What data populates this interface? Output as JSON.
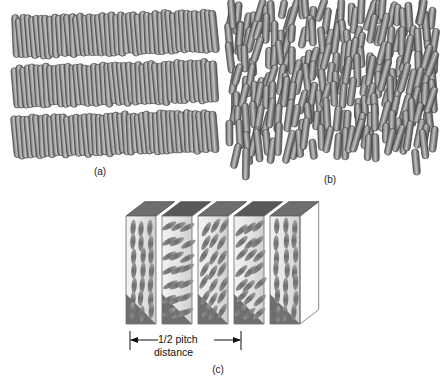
{
  "figure": {
    "panels": [
      {
        "id": "a",
        "label": "(a)",
        "phase_name": "smectic",
        "description": "Rod-shaped molecules arranged in parallel, well-defined stacked layers"
      },
      {
        "id": "b",
        "label": "(b)",
        "phase_name": "nematic",
        "description": "Rod-shaped molecules aligned along a common direction without layered positional order"
      },
      {
        "id": "c",
        "label": "(c)",
        "phase_name": "cholesteric",
        "description": "Stacked slabs in which the molecular director rotates progressively through a half pitch"
      }
    ],
    "dimension": {
      "line1": "1/2 pitch",
      "line2": "distance"
    },
    "colors": {
      "rod_fill": "#7b7b7b",
      "rod_outline": "#3c3c3c",
      "rod_highlight": "#b9b9b9",
      "face_light": "#e9e9e9",
      "face_mid": "#d2d2d2",
      "face_shadow": "#6e6e6e",
      "face_dark": "#585858",
      "ellipse_fill": "#8a8a8a",
      "outline": "#4a4a4a",
      "text": "#111111",
      "background": "#ffffff"
    }
  },
  "chart_data": {
    "type": "diagram",
    "panels": [
      {
        "id": "a",
        "label": "(a)",
        "phase": "smectic",
        "layers": 3,
        "rods_per_layer": 46,
        "order": "positional and orientational",
        "tilt_deg": -4
      },
      {
        "id": "b",
        "label": "(b)",
        "phase": "nematic",
        "layers": 0,
        "rod_count": 210,
        "order": "orientational only",
        "mean_orientation_deg": 84,
        "orientation_spread_deg": 26
      },
      {
        "id": "c",
        "label": "(c)",
        "phase": "cholesteric",
        "slabs": 5,
        "slab_director_angles_deg": [
          86,
          28,
          60,
          44,
          88
        ],
        "dimension_label": "1/2 pitch distance",
        "order": "helical twist of the director"
      }
    ]
  }
}
